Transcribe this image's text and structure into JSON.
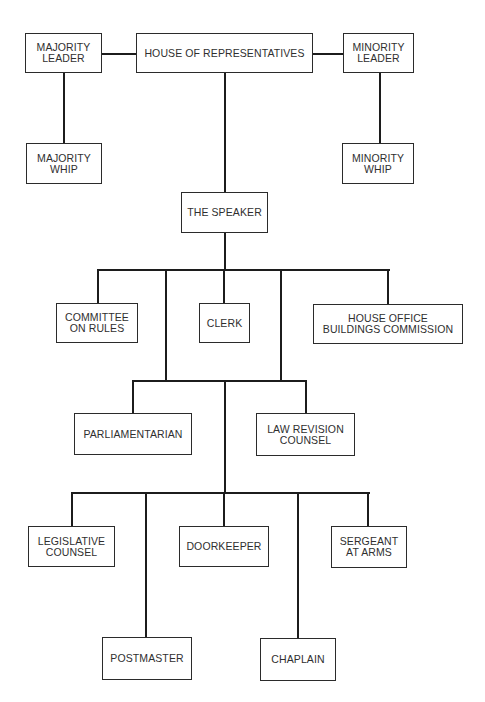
{
  "diagram": {
    "type": "organizational-chart",
    "line_color": "#1c1c1c",
    "box_border_color": "#2b2b2b",
    "text_color": "#2f2f2f",
    "background": "#ffffff",
    "nodes": {
      "house": {
        "label": "HOUSE OF REPRESENTATIVES"
      },
      "majority_leader": {
        "label": "MAJORITY\nLEADER"
      },
      "minority_leader": {
        "label": "MINORITY\nLEADER"
      },
      "majority_whip": {
        "label": "MAJORITY\nWHIP"
      },
      "minority_whip": {
        "label": "MINORITY\nWHIP"
      },
      "speaker": {
        "label": "THE SPEAKER"
      },
      "committee_on_rules": {
        "label": "COMMITTEE\nON RULES"
      },
      "clerk": {
        "label": "CLERK"
      },
      "house_office_buildings": {
        "label": "HOUSE OFFICE\nBUILDINGS COMMISSION"
      },
      "parliamentarian": {
        "label": "PARLIAMENTARIAN"
      },
      "law_revision_counsel": {
        "label": "LAW REVISION\nCOUNSEL"
      },
      "legislative_counsel": {
        "label": "LEGISLATIVE\nCOUNSEL"
      },
      "doorkeeper": {
        "label": "DOORKEEPER"
      },
      "sergeant_at_arms": {
        "label": "SERGEANT\nAT ARMS"
      },
      "postmaster": {
        "label": "POSTMASTER"
      },
      "chaplain": {
        "label": "CHAPLAIN"
      }
    },
    "edges": [
      [
        "house",
        "majority_leader"
      ],
      [
        "house",
        "minority_leader"
      ],
      [
        "majority_leader",
        "majority_whip"
      ],
      [
        "minority_leader",
        "minority_whip"
      ],
      [
        "house",
        "speaker"
      ],
      [
        "speaker",
        "committee_on_rules"
      ],
      [
        "speaker",
        "clerk"
      ],
      [
        "speaker",
        "house_office_buildings"
      ],
      [
        "speaker",
        "parliamentarian"
      ],
      [
        "speaker",
        "law_revision_counsel"
      ],
      [
        "speaker",
        "legislative_counsel"
      ],
      [
        "speaker",
        "postmaster"
      ],
      [
        "speaker",
        "doorkeeper"
      ],
      [
        "speaker",
        "chaplain"
      ],
      [
        "speaker",
        "sergeant_at_arms"
      ]
    ]
  }
}
